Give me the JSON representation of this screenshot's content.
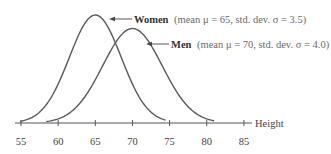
{
  "chart_data": {
    "type": "line",
    "title": "",
    "xlabel": "Height",
    "ylabel": "",
    "xlim": [
      54,
      87
    ],
    "x_ticks": [
      55,
      60,
      65,
      70,
      75,
      80,
      85
    ],
    "x_tick_labels": [
      "55",
      "60",
      "65",
      "70",
      "75",
      "80",
      "85"
    ],
    "grid": false,
    "series": [
      {
        "name": "Women",
        "distribution": "normal",
        "mean": 65,
        "std": 3.5,
        "annotation_bold": "Women",
        "annotation_rest": "(mean μ = 65, std. dev. σ = 3.5)"
      },
      {
        "name": "Men",
        "distribution": "normal",
        "mean": 70,
        "std": 4.0,
        "annotation_bold": "Men",
        "annotation_rest": "(mean μ = 70, std. dev. σ = 4.0)"
      }
    ]
  },
  "colors": {
    "curve": "#5a5a5a",
    "axis": "#555555",
    "text": "#3a3a3a"
  }
}
